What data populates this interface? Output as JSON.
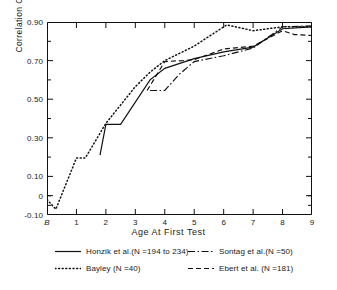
{
  "chart_data": {
    "type": "line",
    "title": "",
    "xlabel": "Age At First Test",
    "ylabel": "Correlation Coefficient",
    "xlim": [
      0,
      9
    ],
    "ylim": [
      -0.1,
      0.9
    ],
    "grid": false,
    "legend_position": "below-axes",
    "x_tick_labels": [
      "B",
      "1",
      "2",
      "3",
      "4",
      "5",
      "6",
      "7",
      "8",
      "9"
    ],
    "x_tick_values": [
      0,
      1,
      2,
      3,
      4,
      5,
      6,
      7,
      8,
      9
    ],
    "y_tick_labels": [
      "0.90",
      "0.70",
      "0.50",
      "0.30",
      "0.10",
      "0",
      "-0.10"
    ],
    "y_tick_values": [
      0.9,
      0.7,
      0.5,
      0.3,
      0.1,
      0.0,
      -0.1
    ],
    "y_minor_tick_values": [
      0.8,
      0.6,
      0.4,
      0.2,
      0.0,
      -0.05
    ],
    "series": [
      {
        "name": "Honzik et al.(N =194 to 234)",
        "style": "solid",
        "color": "#111111",
        "points": [
          [
            1.8,
            0.21
          ],
          [
            2.0,
            0.37
          ],
          [
            2.5,
            0.37
          ],
          [
            3.5,
            0.6
          ],
          [
            4.0,
            0.66
          ],
          [
            5.0,
            0.71
          ],
          [
            6.0,
            0.745
          ],
          [
            7.0,
            0.77
          ],
          [
            8.0,
            0.865
          ],
          [
            9.0,
            0.875
          ]
        ]
      },
      {
        "name": "Bayley (N =40)",
        "style": "dotted",
        "color": "#111111",
        "points": [
          [
            0.0,
            -0.02
          ],
          [
            0.3,
            -0.07
          ],
          [
            1.0,
            0.195
          ],
          [
            1.3,
            0.195
          ],
          [
            2.0,
            0.375
          ],
          [
            3.0,
            0.565
          ],
          [
            3.5,
            0.64
          ],
          [
            4.0,
            0.7
          ],
          [
            5.0,
            0.775
          ],
          [
            6.1,
            0.885
          ],
          [
            7.0,
            0.855
          ],
          [
            8.0,
            0.875
          ],
          [
            9.0,
            0.875
          ]
        ]
      },
      {
        "name": "Sontag et al.(N =50)",
        "style": "dashdot",
        "color": "#111111",
        "points": [
          [
            3.5,
            0.545
          ],
          [
            4.0,
            0.545
          ],
          [
            4.5,
            0.63
          ],
          [
            5.0,
            0.695
          ],
          [
            6.0,
            0.725
          ],
          [
            7.0,
            0.765
          ],
          [
            8.0,
            0.875
          ],
          [
            9.0,
            0.88
          ]
        ]
      },
      {
        "name": "Ebert et al. (N =181)",
        "style": "dashed",
        "color": "#111111",
        "points": [
          [
            3.4,
            0.545
          ],
          [
            4.0,
            0.695
          ],
          [
            4.6,
            0.7
          ],
          [
            5.0,
            0.705
          ],
          [
            6.0,
            0.76
          ],
          [
            7.0,
            0.775
          ],
          [
            8.0,
            0.855
          ],
          [
            8.4,
            0.835
          ],
          [
            9.0,
            0.83
          ]
        ]
      }
    ]
  },
  "axis": {
    "y_title": "Correlation Coefficient",
    "x_title": "Age At First Test"
  },
  "legend": {
    "items": [
      {
        "key": "honzik",
        "style": "solid",
        "label": "Honzik et al.(N =194 to 234)"
      },
      {
        "key": "bayley",
        "style": "dotted",
        "label": "Bayley (N =40)"
      },
      {
        "key": "sontag",
        "style": "dashdot",
        "label": "Sontag et al.(N =50)"
      },
      {
        "key": "ebert",
        "style": "dashed",
        "label": "Ebert et al. (N =181)"
      }
    ]
  },
  "colors": {
    "ink": "#111111",
    "background": "#ffffff"
  }
}
